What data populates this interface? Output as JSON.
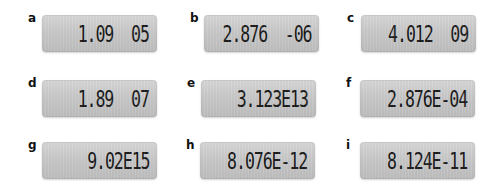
{
  "panels": [
    {
      "label": "a",
      "display": "1.09  05"
    },
    {
      "label": "b",
      "display": "2.876  -06"
    },
    {
      "label": "c",
      "display": "4.012  09"
    },
    {
      "label": "d",
      "display": "1.89  07"
    },
    {
      "label": "e",
      "display": "3.123E13"
    },
    {
      "label": "f",
      "display": "2.876E-04"
    },
    {
      "label": "g",
      "display": "9.02E15"
    },
    {
      "label": "h",
      "display": "8.076E-12"
    },
    {
      "label": "i",
      "display": "8.124E-11"
    }
  ],
  "colors": {
    "lcd_background": "#c8c8c8",
    "digits": "#1a1a1a",
    "label": "#111111"
  }
}
